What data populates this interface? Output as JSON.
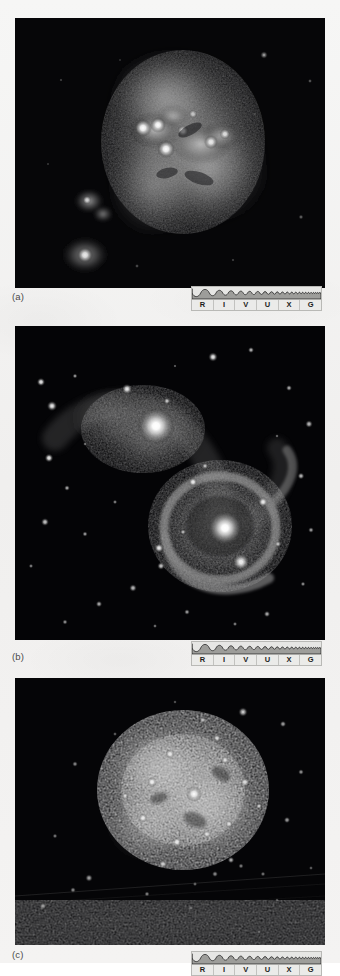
{
  "figure": {
    "kind": "astronomical-image-plate",
    "page_background": "#f2f2f1",
    "panels": [
      {
        "id": "a",
        "label": "(a)",
        "subject": "irregular starburst galaxy with bright central knots",
        "frame": {
          "x": 15,
          "y": 18,
          "width": 310,
          "height": 270
        },
        "label_pos": {
          "x": 12,
          "y": 292
        },
        "background_color": "#050506",
        "spectrum_pos": {
          "x": 191,
          "y": 286
        }
      },
      {
        "id": "b",
        "label": "(b)",
        "subject": "pair of interacting galaxies with tidal bridge and tail",
        "frame": {
          "x": 15,
          "y": 326,
          "width": 310,
          "height": 314
        },
        "label_pos": {
          "x": 12,
          "y": 652
        },
        "background_color": "#040405",
        "spectrum_pos": {
          "x": 191,
          "y": 641
        }
      },
      {
        "id": "c",
        "label": "(c)",
        "subject": "clumpy irregular galaxy resolved into star clusters",
        "frame": {
          "x": 15,
          "y": 678,
          "width": 310,
          "height": 267
        },
        "label_pos": {
          "x": 12,
          "y": 950
        },
        "background_color": "#050507",
        "spectrum_pos": {
          "x": 191,
          "y": 951
        },
        "cropped_at_bottom": true,
        "artifact": "faint diagonal scan streaks across lower third"
      }
    ],
    "spectrum_bar": {
      "caption_bands": [
        "R",
        "I",
        "V",
        "U",
        "X",
        "G"
      ],
      "band_names": [
        "Radio",
        "Infrared",
        "Visible",
        "Ultraviolet",
        "X-ray",
        "Gamma"
      ],
      "fill_color": "#9d9d9a",
      "frame_color": "#b9b9b6",
      "wave_color": "#1b1b1b",
      "description": "wavelength scale with sine wave of increasing frequency from left (radio) to right (gamma)"
    }
  }
}
